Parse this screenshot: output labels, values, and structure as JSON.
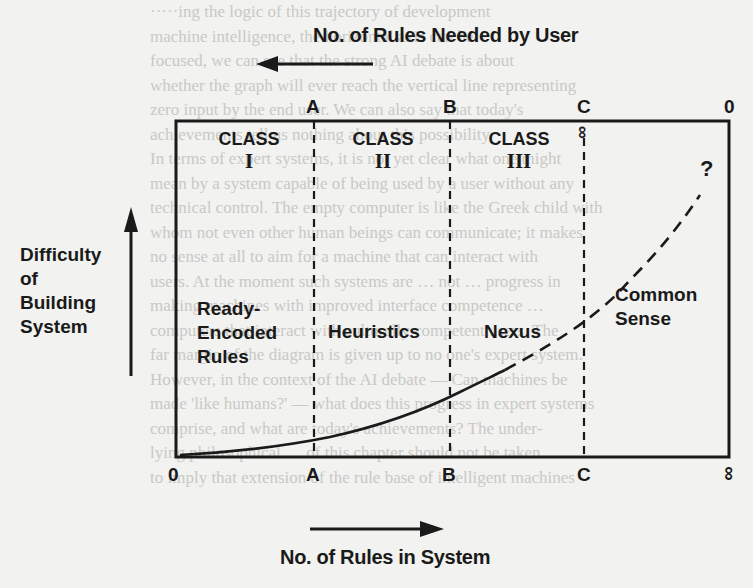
{
  "diagram": {
    "top_axis": {
      "title": "No. of Rules Needed by User",
      "arrow_direction": "left",
      "ticks": [
        "A",
        "B",
        "C",
        "0"
      ],
      "c_extra": "∞"
    },
    "bottom_axis": {
      "title": "No. of Rules in System",
      "arrow_direction": "right",
      "ticks": [
        "0",
        "A",
        "B",
        "C",
        "∞"
      ]
    },
    "y_axis": {
      "title_lines": [
        "Difficulty",
        "of",
        "Building",
        "System"
      ],
      "arrow_direction": "up"
    },
    "classes": [
      {
        "label": "CLASS",
        "numeral": "I"
      },
      {
        "label": "CLASS",
        "numeral": "II"
      },
      {
        "label": "CLASS",
        "numeral": "III"
      }
    ],
    "regions": [
      {
        "lines": [
          "Ready-",
          "Encoded",
          "Rules"
        ]
      },
      {
        "lines": [
          "Heuristics"
        ]
      },
      {
        "lines": [
          "Nexus"
        ]
      },
      {
        "lines": [
          "Common",
          "Sense"
        ]
      }
    ],
    "unknown_marker": "?"
  },
  "background_text": [
    "·····ing the logic of this trajectory of development",
    "machine intelligence, the horizontal axis can be",
    "focused, we can see that the strong AI debate is about",
    "whether the graph will ever reach the vertical line representing",
    "zero input by the end user. We can also say that today's",
    "achievements tell us nothing about this possibility.",
    "  In terms of expert systems, it is not yet clear what one might",
    "mean by a system capable of being used by a user without any",
    "technical control. The empty computer is like the Greek child with",
    "whom not even other human beings can communicate; it makes",
    "no sense at all to aim for a machine that can interact with",
    "users. At the moment such systems are … not … progress in",
    "making machines with improved interface competence …",
    "computers that interact with culturally competent users. The",
    "far margin of the diagram is given up to no one's expert system.",
    "  However, in the context of the AI debate — Can machines be",
    "made 'like humans?' — what does this progress in expert systems",
    "comprise, and what are today's achievements? The under-",
    "lying philosophical … of this chapter should not be taken",
    "to imply that extension of the rule base of intelligent machines"
  ]
}
